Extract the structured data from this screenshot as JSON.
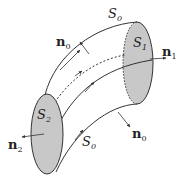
{
  "diagram": {
    "type": "stream tube / control volume",
    "colors": {
      "surface_fill": "#c8c8c8",
      "stroke": "#333333",
      "background": "#ffffff"
    },
    "labels": {
      "s0_top": {
        "base": "S",
        "sub": "0"
      },
      "s0_bottom": {
        "base": "S",
        "sub": "0"
      },
      "s1": {
        "base": "S",
        "sub": "1"
      },
      "s2": {
        "base": "S",
        "sub": "2"
      },
      "n0_top": {
        "base": "n",
        "sub": "0"
      },
      "n0_bottom": {
        "base": "n",
        "sub": "0"
      },
      "n1": {
        "base": "n",
        "sub": "1"
      },
      "n2": {
        "base": "n",
        "sub": "2"
      }
    }
  }
}
